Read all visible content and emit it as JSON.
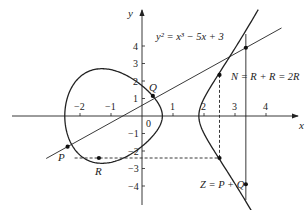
{
  "figure": {
    "equation_label": "y² = x³ − 5x + 3",
    "equation": {
      "a": -5,
      "b": 3
    },
    "axes": {
      "x_label": "x",
      "y_label": "y",
      "origin_label": "0",
      "x_ticks": [
        -2,
        -1,
        1,
        2,
        3,
        4
      ],
      "y_ticks": [
        4,
        3,
        2,
        1,
        -1,
        -2,
        -3,
        -4
      ]
    },
    "points": {
      "P": {
        "label": "P",
        "x": -2.4,
        "y": -1.75
      },
      "R": {
        "label": "R",
        "x": -1.39,
        "y": -2.4
      },
      "Q": {
        "label": "Q",
        "x": 0.35,
        "y": 1.15
      },
      "N": {
        "label": "N",
        "x": 3.35,
        "y": 3.9
      },
      "mirror_upper": {
        "x": 2.5,
        "y": 2.35
      },
      "mirror_lower": {
        "x": 2.5,
        "y": -2.4
      },
      "Z": {
        "label": "Z",
        "x": 3.35,
        "y": -3.9
      }
    },
    "annotations": {
      "N_text": "N = R + R = 2R",
      "Z_text": "Z = P + Q"
    },
    "colors": {
      "stroke": "#222222",
      "background": "#ffffff"
    }
  }
}
